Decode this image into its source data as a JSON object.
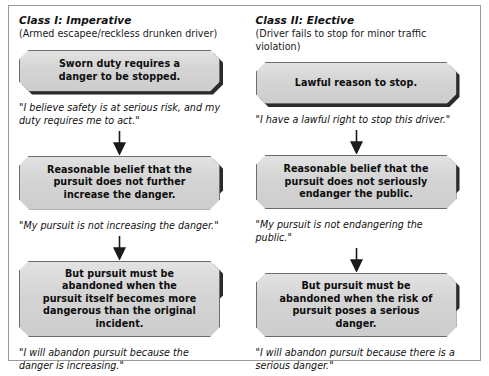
{
  "diagram": {
    "columns": [
      {
        "class_title": "Class I: Imperative",
        "class_subtitle": "(Armed escapee/reckless drunken driver)",
        "steps": [
          {
            "box": "Sworn duty requires a danger to be stopped.",
            "quote": "\"I believe safety is at serious risk, and my duty requires me to act.\""
          },
          {
            "box": "Reasonable belief that the pursuit does not further increase the danger.",
            "quote": "\"My pursuit is not increasing the danger.\""
          },
          {
            "box": "But pursuit must be abandoned when the pursuit itself becomes more dangerous than the original incident.",
            "quote": "\"I will abandon pursuit because the danger is increasing.\""
          }
        ]
      },
      {
        "class_title": "Class II: Elective",
        "class_subtitle": "(Driver fails to stop for minor traffic violation)",
        "steps": [
          {
            "box": "Lawful reason to stop.",
            "quote": "\"I have a lawful right to stop this driver.\""
          },
          {
            "box": "Reasonable belief that the pursuit does not seriously endanger the public.",
            "quote": "\"My pursuit is not endangering the public.\""
          },
          {
            "box": "But pursuit must be abandoned when the risk of pursuit poses a serious danger.",
            "quote": "\"I will abandon pursuit because there is a serious danger.\""
          }
        ]
      }
    ],
    "icons": {
      "arrow": "down-arrow-icon"
    },
    "colors": {
      "box_fill": "#d6d6d6",
      "box_border": "#6d6d6d",
      "box_shadow": "#2b2b2b",
      "frame_border": "#9a9a9a",
      "text": "#111111",
      "background": "#ffffff"
    }
  }
}
